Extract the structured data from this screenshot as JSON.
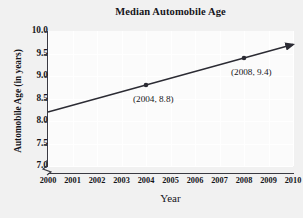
{
  "chart_data": {
    "type": "line",
    "title": "Median Automobile Age",
    "xlabel": "Year",
    "ylabel": "Automobile Age (in years)",
    "x": [
      2000,
      2001,
      2002,
      2003,
      2004,
      2005,
      2006,
      2007,
      2008,
      2009,
      2010
    ],
    "xtick_labels": [
      "2000",
      "2001",
      "2002",
      "2003",
      "2004",
      "2005",
      "2006",
      "2007",
      "2008",
      "2009",
      "2010"
    ],
    "ytick_labels": [
      "10.0",
      "9.5",
      "9.0",
      "8.5",
      "8.0",
      "7.5",
      "7.0"
    ],
    "ytick_values": [
      10.0,
      9.5,
      9.0,
      8.5,
      8.0,
      7.5,
      7.0
    ],
    "xlim": [
      2000,
      2010
    ],
    "ylim": [
      7.0,
      10.0
    ],
    "y_axis_break": true,
    "grid": true,
    "legend": "none",
    "line_color": "#2b2b33",
    "series": [
      {
        "name": "Median automobile age trend",
        "endpoints": [
          {
            "x": 2000,
            "y": 8.2
          },
          {
            "x": 2010,
            "y": 9.7
          }
        ],
        "arrow_end": true
      }
    ],
    "points": [
      {
        "x": 2004,
        "y": 8.8,
        "label": "(2004, 8.8)"
      },
      {
        "x": 2008,
        "y": 9.4,
        "label": "(2008, 9.4)"
      }
    ],
    "annotations": [
      {
        "text": "(2004, 8.8)",
        "for_point": "2004"
      },
      {
        "text": "(2008, 9.4)",
        "for_point": "2008"
      }
    ]
  }
}
